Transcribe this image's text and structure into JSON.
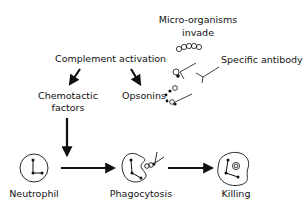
{
  "diagram": {
    "labels": {
      "micro_line1": "Micro-organisms",
      "micro_line2": "invade",
      "complement": "Complement activation",
      "specific_antibody": "Specific antibody",
      "chemotactic_line1": "Chemotactic",
      "chemotactic_line2": "factors",
      "opsonins": "Opsonins",
      "neutrophil": "Neutrophil",
      "phagocytosis": "Phagocytosis",
      "killing": "Killing"
    },
    "icons": [
      "microorganism-chain-icon",
      "antibody-icon",
      "opsonin-dot-icon",
      "neutrophil-cell-icon",
      "phagocyte-cell-icon",
      "killing-cell-icon"
    ],
    "colors": {
      "ink": "#111111",
      "background": "#ffffff"
    }
  }
}
